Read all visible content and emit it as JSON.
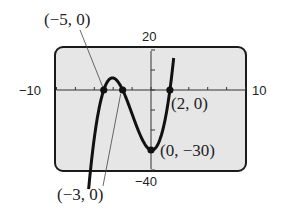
{
  "chart_data": {
    "type": "line",
    "title": "",
    "function": "f(x) = (x + 5)(x + 3)(x - 2)",
    "xlabel": "",
    "ylabel": "",
    "xlim": [
      -10,
      10
    ],
    "ylim": [
      -40,
      20
    ],
    "x_tick_step": 1,
    "y_tick_step": 10,
    "grid": false,
    "legend": null,
    "window_labels": {
      "xmin": "−10",
      "xmax": "10",
      "ymax": "20",
      "ymin": "−40"
    },
    "series": [
      {
        "name": "f(x)",
        "x": [
          -6.6,
          -6,
          -5,
          -4,
          -3,
          -2,
          -1,
          0,
          1,
          2,
          2.4
        ],
        "values": [
          -37.4,
          -24,
          0,
          6,
          0,
          -12,
          -24,
          -30,
          -24,
          0,
          16.6
        ]
      }
    ],
    "points": [
      {
        "x": -5,
        "y": 0,
        "label": "(−5, 0)"
      },
      {
        "x": -3,
        "y": 0,
        "label": "(−3, 0)"
      },
      {
        "x": 2,
        "y": 0,
        "label": "(2, 0)"
      },
      {
        "x": 0,
        "y": -30,
        "label": "(0, −30)"
      }
    ]
  },
  "labels": {
    "xmin": "−10",
    "xmax": "10",
    "ymax": "20",
    "ymin": "−40",
    "p1": "(−5, 0)",
    "p2": "(−3, 0)",
    "p3": "(2, 0)",
    "p4": "(0, −30)"
  }
}
